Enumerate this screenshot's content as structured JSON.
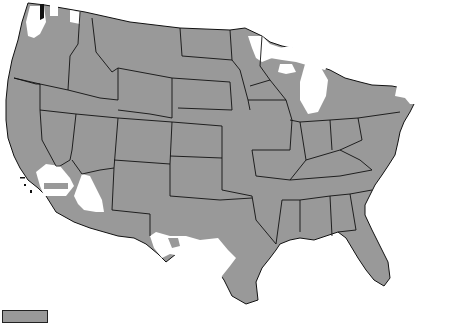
{
  "map": {
    "title": "",
    "region": "Contiguous United States",
    "colors": {
      "shaded": "#999999",
      "unshaded": "#ffffff",
      "border": "#111111"
    },
    "shaded_description": "Most of the contiguous US shaded gray",
    "unshaded_areas": [
      "Maine",
      "New Hampshire",
      "Vermont",
      "Massachusetts",
      "most of New York",
      "Upper Peninsula of Michigan",
      "northern Lower Michigan",
      "northern Minnesota",
      "northern Wisconsin",
      "patches of northern Washington",
      "southeastern California",
      "central Arizona",
      "south and west Texas",
      "southern Florida tip"
    ]
  },
  "legend": {
    "items": [
      {
        "swatch_color": "#999999",
        "label": ""
      }
    ]
  }
}
